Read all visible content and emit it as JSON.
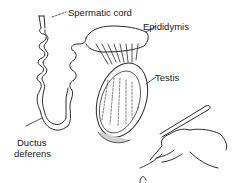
{
  "diagram": {
    "labels": {
      "spermatic_cord": "Spermatic cord",
      "epididymis": "Epididymis",
      "testis": "Testis",
      "ductus_deferens_line1": "Ductus",
      "ductus_deferens_line2": "deferens"
    },
    "colors": {
      "line": "#2a2a2a",
      "shade": "#bdbdbd",
      "background": "#ffffff"
    }
  }
}
